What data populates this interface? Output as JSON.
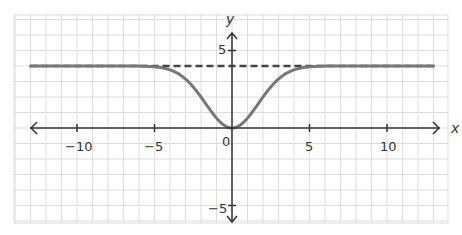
{
  "chart_data": {
    "type": "line",
    "title": "",
    "xlabel": "x",
    "ylabel": "y",
    "xlim": [
      -13.5,
      14.5
    ],
    "ylim": [
      -6.5,
      7
    ],
    "grid": true,
    "grid_step": 1,
    "x_ticks": [
      -10,
      -5,
      0,
      5,
      10
    ],
    "x_tick_labels": [
      "−10",
      "−5",
      "0",
      "5",
      "10"
    ],
    "y_ticks": [
      5,
      -5
    ],
    "y_tick_labels": [
      "5",
      "−5"
    ],
    "origin_label": "0",
    "series": [
      {
        "name": "curve",
        "style": "solid",
        "color": "#777777",
        "formula": "y = 4 - 4*exp(-x^2/5.77)",
        "x_range": [
          -13,
          13
        ],
        "points": [
          [
            -13,
            4
          ],
          [
            -6,
            4
          ],
          [
            -5,
            3.95
          ],
          [
            -4,
            3.75
          ],
          [
            -3,
            3.2
          ],
          [
            -2,
            2.0
          ],
          [
            -1,
            0.67
          ],
          [
            0,
            0
          ],
          [
            1,
            0.67
          ],
          [
            2,
            2.0
          ],
          [
            3,
            3.2
          ],
          [
            4,
            3.75
          ],
          [
            5,
            3.95
          ],
          [
            6,
            4
          ],
          [
            13,
            4
          ]
        ]
      },
      {
        "name": "asymptote y=4",
        "style": "dashed",
        "color": "#444444",
        "y": 4,
        "x_range": [
          -13,
          13
        ]
      }
    ],
    "legend": null
  },
  "labels": {
    "x_axis": "x",
    "y_axis": "y",
    "origin": "0",
    "xt_m10": "−10",
    "xt_m5": "−5",
    "xt_5": "5",
    "xt_10": "10",
    "yt_5": "5",
    "yt_m5": "−5"
  },
  "colors": {
    "grid": "#dddddd",
    "axis": "#333333",
    "curve": "#777777",
    "asymptote": "#444444"
  }
}
